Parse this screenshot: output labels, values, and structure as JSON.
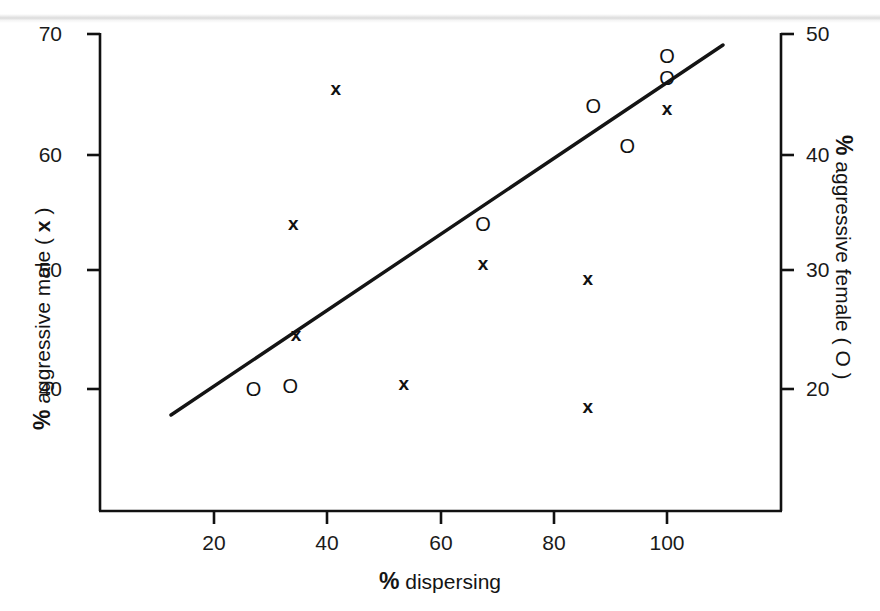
{
  "figure": {
    "background_color": "#ffffff",
    "ink_color": "#111111"
  },
  "axes": {
    "x": {
      "title_prefix": "%",
      "title": " dispersing",
      "ticks": [
        "20",
        "40",
        "60",
        "80",
        "100"
      ],
      "tick_values": [
        20,
        40,
        60,
        80,
        100
      ],
      "range": [
        4,
        116
      ]
    },
    "y_left": {
      "title_prefix": "%",
      "title": " aggressive male ( ",
      "title_glyph": "x",
      "title_suffix": " )",
      "ticks": [
        "70",
        "60",
        "50",
        "40"
      ],
      "tick_values": [
        70,
        60,
        50,
        40
      ],
      "range": [
        29.5,
        70.5
      ]
    },
    "y_right": {
      "title_prefix": "%",
      "title": " aggressive female ( ",
      "title_glyph": "O",
      "title_suffix": " )",
      "ticks": [
        "50",
        "40",
        "30",
        "20"
      ],
      "tick_values": [
        50,
        40,
        30,
        20
      ],
      "range": [
        13.5,
        50.3
      ]
    }
  },
  "markers": {
    "male_glyph": "x",
    "female_glyph": "O"
  },
  "chart_data": {
    "type": "scatter",
    "title": "",
    "xlabel": "% dispersing",
    "ylabel": "% aggressive male ( x )",
    "y2label": "% aggressive female ( O )",
    "xlim": [
      4,
      116
    ],
    "ylim": [
      29.5,
      70.5
    ],
    "y2lim": [
      13.5,
      50.3
    ],
    "grid": false,
    "legend": "inline-in-axis-labels",
    "series": [
      {
        "name": "% aggressive male ( x )",
        "marker": "x",
        "axis": "left",
        "points": [
          {
            "x": 34.0,
            "y": 54.1
          },
          {
            "x": 34.5,
            "y": 44.7
          },
          {
            "x": 41.5,
            "y": 65.5
          },
          {
            "x": 53.5,
            "y": 40.5
          },
          {
            "x": 67.5,
            "y": 50.7
          },
          {
            "x": 86.0,
            "y": 49.4
          },
          {
            "x": 86.0,
            "y": 38.6
          },
          {
            "x": 100.0,
            "y": 63.8
          }
        ]
      },
      {
        "name": "% aggressive female ( O )",
        "marker": "o",
        "axis": "right",
        "points": [
          {
            "x": 27.0,
            "y": 20.0
          },
          {
            "x": 33.5,
            "y": 20.3
          },
          {
            "x": 67.5,
            "y": 34.0
          },
          {
            "x": 87.0,
            "y": 44.0
          },
          {
            "x": 93.0,
            "y": 40.6
          },
          {
            "x": 100.0,
            "y": 46.4
          },
          {
            "x": 100.0,
            "y": 48.2
          }
        ]
      }
    ],
    "fit_line": {
      "name": "regression line",
      "x_start": 12.8,
      "y_start_left": 38.1,
      "x_end": 110.5,
      "y_end_left": 69.2
    }
  }
}
